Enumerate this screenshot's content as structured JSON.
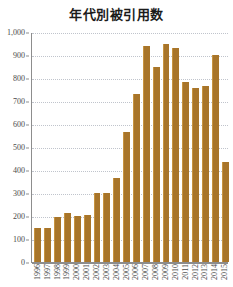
{
  "chart_data": {
    "type": "bar",
    "title": "年代別被引用数",
    "xlabel": "",
    "ylabel": "",
    "ylim": [
      0,
      1000
    ],
    "ytick_step": 100,
    "grid": true,
    "legend": null,
    "bar_color": "#a8752a",
    "categories": [
      "1996",
      "1997",
      "1998",
      "1999",
      "2000",
      "2001",
      "2002",
      "2003",
      "2004",
      "2005",
      "2006",
      "2007",
      "2008",
      "2009",
      "2010",
      "2011",
      "2012",
      "2013",
      "2014",
      "2015"
    ],
    "values": [
      148,
      148,
      197,
      213,
      198,
      206,
      298,
      298,
      366,
      565,
      730,
      940,
      848,
      950,
      932,
      782,
      758,
      765,
      898,
      433
    ],
    "ytick_labels": [
      "1,000",
      "900",
      "800",
      "700",
      "600",
      "500",
      "400",
      "300",
      "200",
      "100",
      "0"
    ],
    "ytick_values": [
      1000,
      900,
      800,
      700,
      600,
      500,
      400,
      300,
      200,
      100,
      0
    ]
  }
}
